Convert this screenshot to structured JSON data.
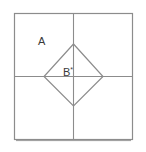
{
  "figure": {
    "canvas": {
      "width": 146,
      "height": 152,
      "background": "#ffffff"
    },
    "colors": {
      "outer_square_stroke": "#8c8c8c",
      "median_line_stroke": "#8c8c8c",
      "diamond_stroke": "#8c8c8c",
      "bottom_edge_shadow": "#5a5a5a",
      "label_text": "#3a3a3a"
    },
    "outer_square": {
      "name": "outer-square",
      "left": 14,
      "top": 13,
      "right": 133,
      "bottom": 140,
      "width": 119,
      "height": 127,
      "stroke_width": 1
    },
    "median_lines": {
      "vertical_x": 73,
      "horizontal_y": 76,
      "stroke_width": 1
    },
    "diamond": {
      "name": "inscribed-diamond",
      "vertices": [
        {
          "label": "top",
          "x": 73,
          "y": 44
        },
        {
          "label": "right",
          "x": 103,
          "y": 76
        },
        {
          "label": "bottom",
          "x": 73,
          "y": 106
        },
        {
          "label": "left",
          "x": 44,
          "y": 76
        }
      ],
      "points_attr": "73,44 103,76 73,106 44,76",
      "stroke_width": 1
    },
    "labels": {
      "region_a": {
        "text": "A",
        "x": 38,
        "y": 45
      },
      "region_b": {
        "text": "B",
        "superscript": "*",
        "x": 63,
        "y": 76
      }
    }
  }
}
